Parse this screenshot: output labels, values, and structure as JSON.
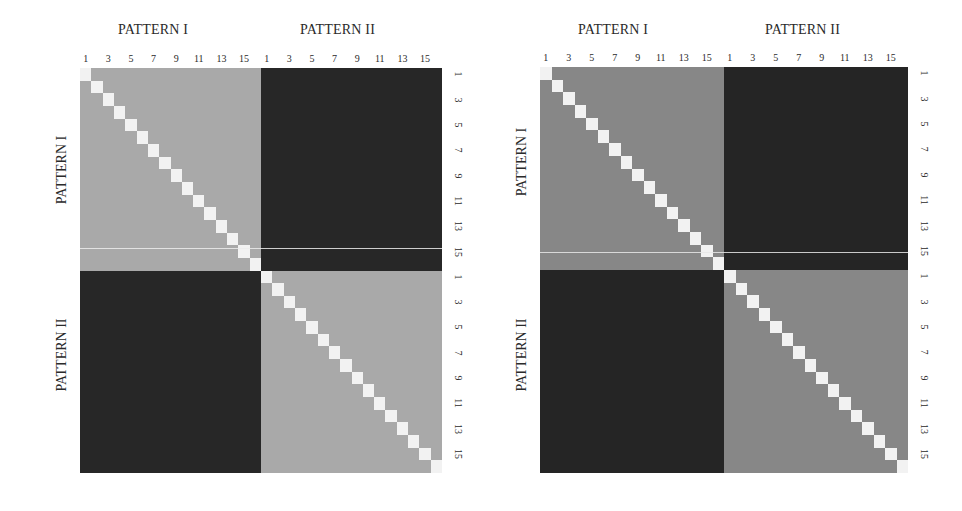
{
  "chart_data": [
    {
      "type": "heatmap",
      "title": "",
      "panel": "left",
      "size": 32,
      "groups": [
        "PATTERN I",
        "PATTERN II"
      ],
      "group_size": 16,
      "x_group_labels": [
        "PATTERN I",
        "PATTERN II"
      ],
      "y_group_labels": [
        "PATTERN I",
        "PATTERN II"
      ],
      "x_tick_labels": [
        "1",
        "3",
        "5",
        "7",
        "9",
        "11",
        "13",
        "15",
        "1",
        "3",
        "5",
        "7",
        "9",
        "11",
        "13",
        "15"
      ],
      "y_tick_labels": [
        "1",
        "3",
        "5",
        "7",
        "9",
        "11",
        "13",
        "15",
        "1",
        "3",
        "5",
        "7",
        "9",
        "11",
        "13",
        "15"
      ],
      "description": "32x32 similarity matrix: diagonal cells white (self-similarity), within-pattern blocks medium grey, between-pattern blocks dark",
      "colors": {
        "diagonal": "#f2f2f2",
        "within_pattern": "#a9a9a9",
        "between_pattern": "#272727",
        "separator_line": "#ececec"
      },
      "block_values": [
        [
          0.6,
          0.1
        ],
        [
          0.1,
          0.6
        ]
      ],
      "diagonal_value": 1.0
    },
    {
      "type": "heatmap",
      "title": "",
      "panel": "right",
      "size": 32,
      "groups": [
        "PATTERN I",
        "PATTERN II"
      ],
      "group_size": 16,
      "x_group_labels": [
        "PATTERN I",
        "PATTERN II"
      ],
      "y_group_labels": [
        "PATTERN I",
        "PATTERN II"
      ],
      "x_tick_labels": [
        "1",
        "3",
        "5",
        "7",
        "9",
        "11",
        "13",
        "15",
        "1",
        "3",
        "5",
        "7",
        "9",
        "11",
        "13",
        "15"
      ],
      "y_tick_labels": [
        "1",
        "3",
        "5",
        "7",
        "9",
        "11",
        "13",
        "15",
        "1",
        "3",
        "5",
        "7",
        "9",
        "11",
        "13",
        "15"
      ],
      "description": "32x32 similarity matrix: diagonal cells white, within-pattern blocks darker grey than left panel, between-pattern blocks dark",
      "colors": {
        "diagonal": "#f2f2f2",
        "within_pattern": "#878787",
        "between_pattern": "#252525",
        "separator_line": "#e8e8e8"
      },
      "block_values": [
        [
          0.45,
          0.1
        ],
        [
          0.1,
          0.45
        ]
      ],
      "diagonal_value": 1.0
    }
  ],
  "panels": [
    {
      "top_group_labels": [
        "PATTERN I",
        "PATTERN II"
      ],
      "left_group_labels": [
        "PATTERN I",
        "PATTERN II"
      ],
      "top_ticks": [
        "1",
        "3",
        "5",
        "7",
        "9",
        "11",
        "13",
        "15",
        "1",
        "3",
        "5",
        "7",
        "9",
        "11",
        "13",
        "15"
      ],
      "right_ticks": [
        "1",
        "3",
        "5",
        "7",
        "9",
        "11",
        "13",
        "15",
        "1",
        "3",
        "5",
        "7",
        "9",
        "11",
        "13",
        "15"
      ]
    },
    {
      "top_group_labels": [
        "PATTERN I",
        "PATTERN II"
      ],
      "left_group_labels": [
        "PATTERN I",
        "PATTERN II"
      ],
      "top_ticks": [
        "1",
        "3",
        "5",
        "7",
        "9",
        "11",
        "13",
        "15",
        "1",
        "3",
        "5",
        "7",
        "9",
        "11",
        "13",
        "15"
      ],
      "right_ticks": [
        "1",
        "3",
        "5",
        "7",
        "9",
        "11",
        "13",
        "15",
        "1",
        "3",
        "5",
        "7",
        "9",
        "11",
        "13",
        "15"
      ]
    }
  ]
}
